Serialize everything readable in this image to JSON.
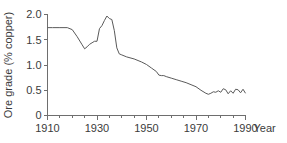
{
  "chart_data": {
    "type": "line",
    "title": "",
    "xlabel": "Year",
    "ylabel": "Ore grade (% copper)",
    "xlim": [
      1910,
      1990
    ],
    "ylim": [
      0,
      2.0
    ],
    "grid": false,
    "legend": null,
    "x_ticks": [
      1910,
      1930,
      1950,
      1970,
      1990
    ],
    "x_tick_labels": [
      "1910",
      "1930",
      "1950",
      "1970",
      "1990"
    ],
    "x_minor_tick_step": 5,
    "y_ticks": [
      0,
      0.5,
      1.0,
      1.5,
      2.0
    ],
    "y_tick_labels": [
      "0",
      "0.5",
      "1.0",
      "1.5",
      "2.0"
    ],
    "series": [
      {
        "name": "Ore grade",
        "x": [
          1910,
          1912,
          1915,
          1918,
          1920,
          1922,
          1924,
          1925,
          1926,
          1927,
          1928,
          1929,
          1930,
          1931,
          1932,
          1933,
          1934,
          1935,
          1936,
          1937,
          1938,
          1939,
          1940,
          1942,
          1945,
          1948,
          1950,
          1952,
          1954,
          1955,
          1956,
          1957,
          1958,
          1960,
          1962,
          1964,
          1966,
          1968,
          1970,
          1972,
          1974,
          1975,
          1976,
          1977,
          1978,
          1979,
          1980,
          1981,
          1982,
          1983,
          1984,
          1985,
          1986,
          1987,
          1988,
          1989,
          1990
        ],
        "values": [
          1.74,
          1.74,
          1.74,
          1.74,
          1.7,
          1.56,
          1.4,
          1.32,
          1.36,
          1.41,
          1.44,
          1.47,
          1.47,
          1.72,
          1.78,
          1.88,
          1.97,
          1.92,
          1.9,
          1.68,
          1.34,
          1.22,
          1.2,
          1.16,
          1.12,
          1.06,
          1.01,
          0.94,
          0.87,
          0.8,
          0.79,
          0.79,
          0.77,
          0.74,
          0.71,
          0.68,
          0.65,
          0.61,
          0.57,
          0.5,
          0.44,
          0.42,
          0.44,
          0.47,
          0.46,
          0.49,
          0.46,
          0.53,
          0.51,
          0.43,
          0.49,
          0.44,
          0.52,
          0.51,
          0.45,
          0.52,
          0.44
        ]
      }
    ]
  },
  "colors": {
    "line": "#5a5a5a",
    "axis": "#6e6e6e",
    "text": "#3b3b3b",
    "background": "#ffffff"
  }
}
